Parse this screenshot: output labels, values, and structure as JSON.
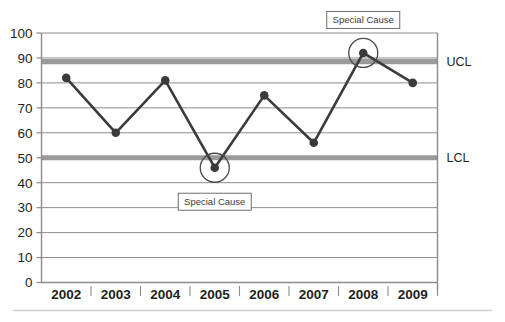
{
  "chart_data": {
    "type": "line",
    "title": "",
    "subtitle": "",
    "xlabel": "",
    "ylabel": "",
    "categories": [
      "2002",
      "2003",
      "2004",
      "2005",
      "2006",
      "2007",
      "2008",
      "2009"
    ],
    "series": [
      {
        "name": "Measurement",
        "values": [
          82,
          60,
          81,
          46,
          75,
          56,
          92,
          80
        ]
      }
    ],
    "ylim": [
      0,
      100
    ],
    "ytick_values": [
      0,
      10,
      20,
      30,
      40,
      50,
      60,
      70,
      80,
      90,
      100
    ],
    "ytick_labels": [
      "0",
      "10",
      "20",
      "30",
      "40",
      "50",
      "60",
      "70",
      "80",
      "90",
      "100"
    ],
    "grid": true,
    "legend": false,
    "legend_position": "none",
    "control_limits": [
      {
        "name": "UCL",
        "label": "UCL",
        "value": 88.5
      },
      {
        "name": "LCL",
        "label": "LCL",
        "value": 50
      }
    ],
    "annotations": [
      {
        "label": "Special Cause",
        "category": "2008",
        "value": 92,
        "position": "above"
      },
      {
        "label": "Special Cause",
        "category": "2005",
        "value": 46,
        "position": "below"
      }
    ],
    "highlighted_points": [
      "2005",
      "2008"
    ],
    "colors": {
      "line": "#3b3b3b",
      "marker": "#3b3b3b",
      "gridline": "#8c8c8c",
      "control_limit_band": "#9a9a9a",
      "axis": "#8c8c8c",
      "text": "#231f20",
      "annotation_box_border": "#6e6e6e",
      "annotation_box_fill": "#ffffff",
      "footer_rule": "#cfcfcf"
    }
  }
}
